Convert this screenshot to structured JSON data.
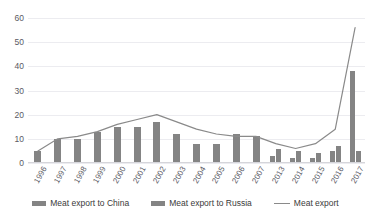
{
  "chart": {
    "title": "",
    "y_axis": {
      "ticks": [
        "0",
        "10",
        "20",
        "30",
        "40",
        "50",
        "60"
      ]
    },
    "legend": [
      {
        "label": "Meat export to China",
        "marker": "bar-swatch",
        "color": "#848484"
      },
      {
        "label": "Meat export to Russia",
        "marker": "bar-swatch",
        "color": "#848484"
      },
      {
        "label": "Meat export",
        "marker": "line-swatch",
        "color": "#8a8a8a"
      }
    ]
  },
  "chart_data": {
    "type": "bar",
    "title": "",
    "xlabel": "",
    "ylabel": "",
    "ylim": [
      0,
      60
    ],
    "yticks": [
      0,
      10,
      20,
      30,
      40,
      50,
      60
    ],
    "grid": true,
    "legend_position": "bottom",
    "categories": [
      "1996",
      "1997",
      "1998",
      "1999",
      "2000",
      "2001",
      "2002",
      "2003",
      "2004",
      "2005",
      "2006",
      "2007",
      "2013",
      "2014",
      "2015",
      "2016",
      "2017"
    ],
    "series": [
      {
        "name": "Meat export to China",
        "type": "bar",
        "color": "#848484",
        "values": [
          5,
          10,
          10,
          13,
          15,
          15,
          17,
          12,
          8,
          8,
          12,
          11,
          3,
          2,
          2,
          5,
          38
        ]
      },
      {
        "name": "Meat export to Russia",
        "type": "bar",
        "color": "#848484",
        "values": [
          0,
          0,
          0,
          0,
          0,
          0,
          0,
          0,
          0,
          0,
          0,
          0,
          6,
          5,
          4,
          7,
          5
        ]
      },
      {
        "name": "Meat export",
        "type": "line",
        "color": "#8a8a8a",
        "values": [
          5,
          10,
          11,
          13,
          16,
          18,
          20,
          17,
          14,
          12,
          11,
          11,
          8,
          6,
          8,
          14,
          56
        ]
      }
    ]
  }
}
